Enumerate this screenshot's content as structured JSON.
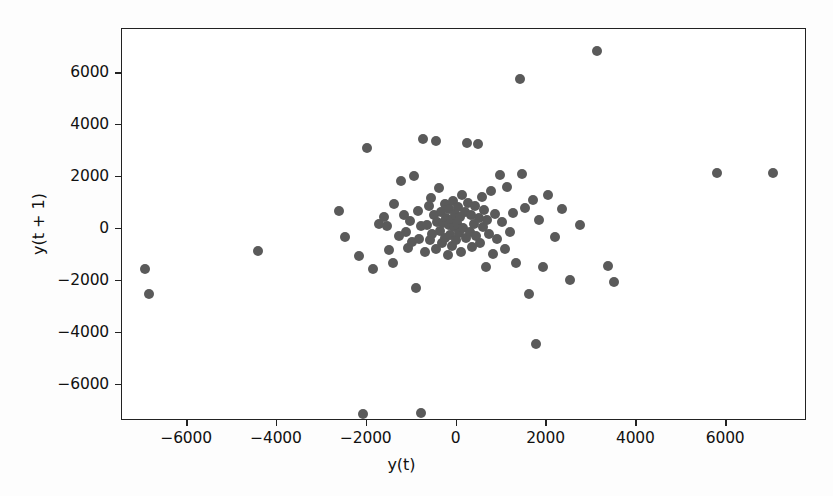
{
  "chart_data": {
    "type": "scatter",
    "title": "",
    "xlabel": "y(t)",
    "ylabel": "y(t + 1)",
    "xlim": [
      -7450,
      7800
    ],
    "ylim": [
      -7400,
      7700
    ],
    "xticks": [
      -6000,
      -4000,
      -2000,
      0,
      2000,
      4000,
      6000
    ],
    "xtick_labels": [
      "−6000",
      "−4000",
      "−2000",
      "0",
      "2000",
      "4000",
      "6000"
    ],
    "yticks": [
      -6000,
      -4000,
      -2000,
      0,
      2000,
      4000,
      6000
    ],
    "ytick_labels": [
      "−6000",
      "−4000",
      "−2000",
      "0",
      "2000",
      "4000",
      "6000"
    ],
    "grid": false,
    "legend": null,
    "marker_color": "#5a5a5a",
    "marker_size": 10,
    "points": [
      [
        -6940,
        -1540
      ],
      [
        -6850,
        -2500
      ],
      [
        -4420,
        -850
      ],
      [
        -2630,
        700
      ],
      [
        -2480,
        -310
      ],
      [
        -2170,
        -1040
      ],
      [
        -2090,
        -7120
      ],
      [
        -1990,
        3120
      ],
      [
        -1860,
        -1540
      ],
      [
        -1730,
        190
      ],
      [
        -1620,
        460
      ],
      [
        -1560,
        120
      ],
      [
        -1510,
        -810
      ],
      [
        -1420,
        -1310
      ],
      [
        -1390,
        960
      ],
      [
        -1290,
        -270
      ],
      [
        -1240,
        1850
      ],
      [
        -1180,
        540
      ],
      [
        -1120,
        -120
      ],
      [
        -1080,
        -730
      ],
      [
        -1040,
        310
      ],
      [
        -990,
        -500
      ],
      [
        -940,
        2040
      ],
      [
        -900,
        -2270
      ],
      [
        -860,
        690
      ],
      [
        -830,
        -380
      ],
      [
        -800,
        120
      ],
      [
        -790,
        -7080
      ],
      [
        -760,
        3460
      ],
      [
        -700,
        -900
      ],
      [
        -660,
        150
      ],
      [
        -620,
        870
      ],
      [
        -600,
        -420
      ],
      [
        -560,
        1180
      ],
      [
        -540,
        -180
      ],
      [
        -500,
        520
      ],
      [
        -470,
        3400
      ],
      [
        -450,
        -760
      ],
      [
        -430,
        260
      ],
      [
        -400,
        1560
      ],
      [
        -380,
        -90
      ],
      [
        -350,
        640
      ],
      [
        -330,
        -560
      ],
      [
        -300,
        210
      ],
      [
        -270,
        950
      ],
      [
        -250,
        -340
      ],
      [
        -230,
        430
      ],
      [
        -200,
        -1000
      ],
      [
        -180,
        160
      ],
      [
        -160,
        780
      ],
      [
        -140,
        -230
      ],
      [
        -120,
        350
      ],
      [
        -100,
        -640
      ],
      [
        -80,
        1090
      ],
      [
        -60,
        60
      ],
      [
        -40,
        590
      ],
      [
        -20,
        -420
      ],
      [
        10,
        240
      ],
      [
        30,
        840
      ],
      [
        50,
        -150
      ],
      [
        70,
        470
      ],
      [
        90,
        -880
      ],
      [
        120,
        1320
      ],
      [
        150,
        30
      ],
      [
        180,
        660
      ],
      [
        210,
        -360
      ],
      [
        240,
        3320
      ],
      [
        260,
        1010
      ],
      [
        290,
        -120
      ],
      [
        320,
        530
      ],
      [
        350,
        -700
      ],
      [
        380,
        200
      ],
      [
        410,
        890
      ],
      [
        440,
        -260
      ],
      [
        470,
        3280
      ],
      [
        500,
        420
      ],
      [
        530,
        -530
      ],
      [
        560,
        1240
      ],
      [
        590,
        90
      ],
      [
        620,
        710
      ],
      [
        650,
        -1480
      ],
      [
        680,
        330
      ],
      [
        710,
        -180
      ],
      [
        760,
        1460
      ],
      [
        800,
        -980
      ],
      [
        860,
        560
      ],
      [
        900,
        -400
      ],
      [
        960,
        2090
      ],
      [
        1010,
        250
      ],
      [
        1070,
        -760
      ],
      [
        1130,
        1620
      ],
      [
        1190,
        -120
      ],
      [
        1250,
        610
      ],
      [
        1320,
        -1310
      ],
      [
        1400,
        5780
      ],
      [
        1450,
        2130
      ],
      [
        1520,
        800
      ],
      [
        1610,
        -2510
      ],
      [
        1690,
        1130
      ],
      [
        1760,
        -4450
      ],
      [
        1840,
        340
      ],
      [
        1930,
        -1460
      ],
      [
        2040,
        1290
      ],
      [
        2190,
        -300
      ],
      [
        2340,
        780
      ],
      [
        2520,
        -1960
      ],
      [
        2740,
        140
      ],
      [
        3120,
        6850
      ],
      [
        3380,
        -1430
      ],
      [
        3510,
        -2040
      ],
      [
        5790,
        2160
      ],
      [
        7040,
        2160
      ]
    ]
  }
}
